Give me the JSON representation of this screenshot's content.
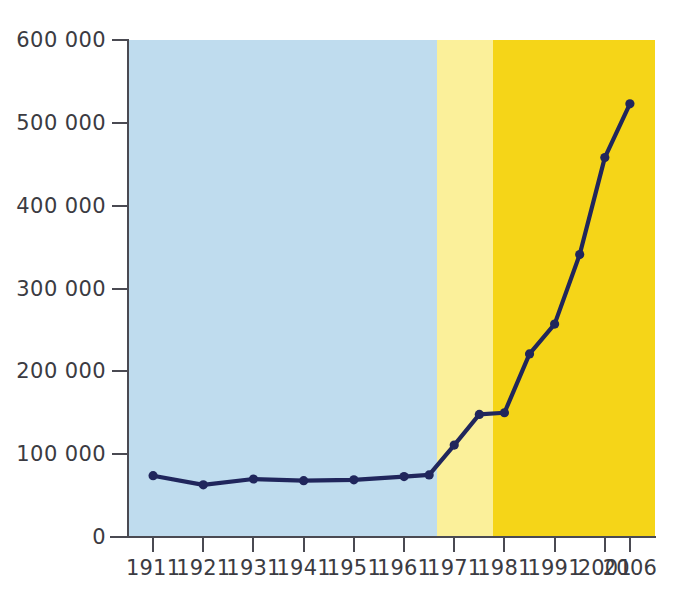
{
  "chart_data": {
    "type": "line",
    "title": "",
    "subtitle": "",
    "xlabel": "",
    "ylabel": "",
    "x": [
      1911,
      1921,
      1931,
      1941,
      1951,
      1961,
      1966,
      1971,
      1976,
      1981,
      1986,
      1991,
      1996,
      2001,
      2006
    ],
    "values": [
      74000,
      63000,
      70000,
      68000,
      69000,
      73000,
      75000,
      111000,
      148000,
      150000,
      221000,
      257000,
      341000,
      458000,
      523000
    ],
    "series": [
      {
        "name": "Population",
        "values": [
          74000,
          63000,
          70000,
          68000,
          69000,
          73000,
          75000,
          111000,
          148000,
          150000,
          221000,
          257000,
          341000,
          458000,
          523000
        ]
      }
    ],
    "x_tick_labels": [
      "1911",
      "1921",
      "1931",
      "1941",
      "1951",
      "1961",
      "1971",
      "1981",
      "1991",
      "2001",
      "2006"
    ],
    "x_tick_values": [
      1911,
      1921,
      1931,
      1941,
      1951,
      1961,
      1971,
      1981,
      1991,
      2001,
      2006
    ],
    "y_tick_labels": [
      "0",
      "100 000",
      "200 000",
      "300 000",
      "400 000",
      "500 000",
      "600 000"
    ],
    "y_tick_values": [
      0,
      100000,
      200000,
      300000,
      400000,
      500000,
      600000
    ],
    "ylim": [
      0,
      600000
    ],
    "xlim": [
      1906,
      2011
    ],
    "grid": false,
    "legend": "none",
    "marker": "circle",
    "line_color": "#20265c",
    "marker_color": "#20265c",
    "axis_color": "#4a4a52",
    "background_bands": [
      {
        "name": "band-light-blue",
        "from": 1906,
        "to": 1967.5,
        "color": "#bfdcee"
      },
      {
        "name": "band-pale-yellow",
        "from": 1967.5,
        "to": 1978.8,
        "color": "#fbf09a"
      },
      {
        "name": "band-yellow",
        "from": 1978.8,
        "to": 2011,
        "color": "#f5d518"
      }
    ]
  }
}
